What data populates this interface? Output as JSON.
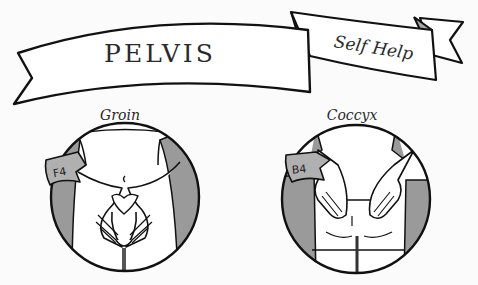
{
  "header": {
    "title": "PELVIS",
    "subtitle": "Self Help"
  },
  "panels": [
    {
      "label": "Groin",
      "tag": "F4",
      "view": "front"
    },
    {
      "label": "Coccyx",
      "tag": "B4",
      "view": "back"
    }
  ],
  "colors": {
    "line": "#1a1a1a",
    "fill": "#ffffff",
    "shade": "#9a9a9a",
    "background": "#fbfbfb"
  }
}
